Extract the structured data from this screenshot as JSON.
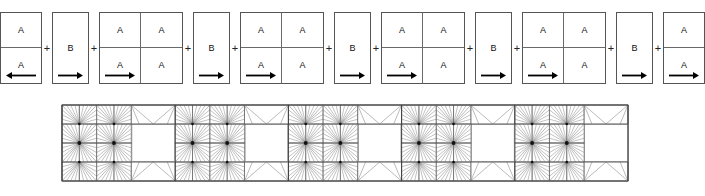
{
  "figure": {
    "name": "periodic-unit-cell-decomposition-and-mesh",
    "background": "#ffffff",
    "line_color": "#555555",
    "inner_line_color": "#6a6a6a",
    "text_color": "#111111",
    "arrow_color": "#000000"
  },
  "top_row": {
    "name": "block-sequence",
    "separator": "+",
    "blocks": [
      {
        "id": "block-1",
        "kind": "A",
        "cols": 1,
        "rows": 2,
        "width": 42,
        "arrow": "left",
        "cells": [
          "A",
          "A"
        ]
      },
      {
        "id": "block-2",
        "kind": "B",
        "cols": 1,
        "rows": 1,
        "width": 37,
        "arrow": "right",
        "cells": [
          "B"
        ]
      },
      {
        "id": "block-3",
        "kind": "A",
        "cols": 2,
        "rows": 2,
        "width": 84,
        "arrow": "right",
        "cells": [
          "A",
          "A",
          "A",
          "A"
        ]
      },
      {
        "id": "block-4",
        "kind": "B",
        "cols": 1,
        "rows": 1,
        "width": 37,
        "arrow": "right",
        "cells": [
          "B"
        ]
      },
      {
        "id": "block-5",
        "kind": "A",
        "cols": 2,
        "rows": 2,
        "width": 84,
        "arrow": "right",
        "cells": [
          "A",
          "A",
          "A",
          "A"
        ]
      },
      {
        "id": "block-6",
        "kind": "B",
        "cols": 1,
        "rows": 1,
        "width": 37,
        "arrow": "right",
        "cells": [
          "B"
        ]
      },
      {
        "id": "block-7",
        "kind": "A",
        "cols": 2,
        "rows": 2,
        "width": 84,
        "arrow": "right",
        "cells": [
          "A",
          "A",
          "A",
          "A"
        ]
      },
      {
        "id": "block-8",
        "kind": "B",
        "cols": 1,
        "rows": 1,
        "width": 37,
        "arrow": "right",
        "cells": [
          "B"
        ]
      },
      {
        "id": "block-9",
        "kind": "A",
        "cols": 2,
        "rows": 2,
        "width": 84,
        "arrow": "right",
        "cells": [
          "A",
          "A",
          "A",
          "A"
        ]
      },
      {
        "id": "block-10",
        "kind": "B",
        "cols": 1,
        "rows": 1,
        "width": 37,
        "arrow": "right",
        "cells": [
          "B"
        ]
      },
      {
        "id": "block-11",
        "kind": "A",
        "cols": 1,
        "rows": 2,
        "width": 42,
        "arrow": "right",
        "cells": [
          "A",
          "A"
        ]
      }
    ]
  },
  "mesh": {
    "name": "triangular-finite-element-mesh",
    "x": 62,
    "y": 9,
    "width": 566,
    "height": 76,
    "rows": 4,
    "periods": 5,
    "star_blocks_per_period": 2,
    "void_blocks_per_period": 1,
    "outline_color": "#333333",
    "grid_color": "#555555",
    "tri_color": "#777777",
    "node_color": "#111111",
    "void_fill": "#ffffff"
  }
}
